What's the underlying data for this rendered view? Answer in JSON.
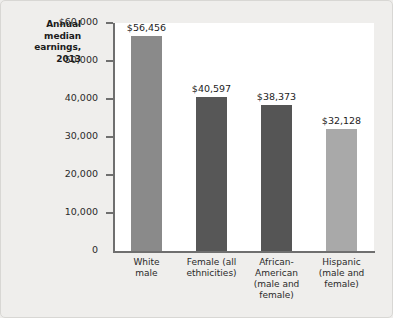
{
  "chart_data": {
    "type": "bar",
    "title": "Annual median earnings, 2013",
    "title_lines": [
      "Annual",
      "median",
      "earnings,",
      "2013"
    ],
    "xlabel": "",
    "ylabel": "Annual median earnings, 2013",
    "ylim": [
      0,
      60000
    ],
    "grid": false,
    "legend": "none",
    "categories": [
      "White male",
      "Female (all ethnicities)",
      "African-American (male and female)",
      "Hispanic (male and female)"
    ],
    "category_lines": [
      [
        "White",
        "male"
      ],
      [
        "Female (all",
        "ethnicities)"
      ],
      [
        "African-",
        "American",
        "(male and",
        "female)"
      ],
      [
        "Hispanic",
        "(male and",
        "female)"
      ]
    ],
    "values": [
      56456,
      40597,
      38373,
      32128
    ],
    "value_labels": [
      "$56,456",
      "$40,597",
      "$38,373",
      "$32,128"
    ],
    "bar_colors": [
      "#8a8a8a",
      "#575757",
      "#555555",
      "#a9a9a9"
    ],
    "yticks": [
      60000,
      50000,
      40000,
      30000,
      20000,
      10000,
      0
    ],
    "ytick_labels": [
      "$60,000",
      "50,000",
      "40,000",
      "30,000",
      "20,000",
      "10,000",
      "0"
    ]
  }
}
